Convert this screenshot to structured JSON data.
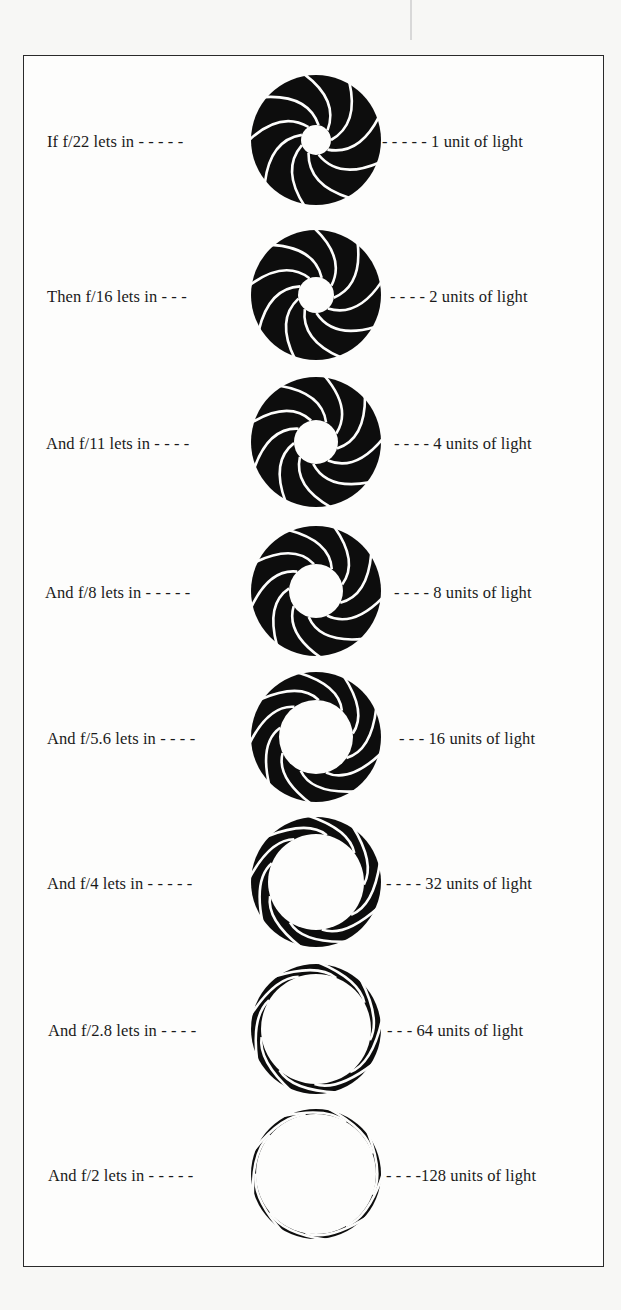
{
  "figure": {
    "title": "",
    "ink_color": "#0d0d0d",
    "paper_color": "#fdfdfc",
    "rows": [
      {
        "left": "If f/22 lets in - - - - -",
        "right": "- - - - - 1 unit of light",
        "f_stop": "f/22",
        "units": 1,
        "inner_radius": 15
      },
      {
        "left": "Then f/16 lets in - - -",
        "right": "- - - - 2 units of light",
        "f_stop": "f/16",
        "units": 2,
        "inner_radius": 18
      },
      {
        "left": "And f/11 lets in - - - -",
        "right": "- - - - 4 units of light",
        "f_stop": "f/11",
        "units": 4,
        "inner_radius": 22
      },
      {
        "left": "And f/8 lets in - - - - -",
        "right": "- - - - 8 units of light",
        "f_stop": "f/8",
        "units": 8,
        "inner_radius": 27
      },
      {
        "left": "And f/5.6 lets in - - - -",
        "right": "- - - 16 units of light",
        "f_stop": "f/5.6",
        "units": 16,
        "inner_radius": 37
      },
      {
        "left": "And f/4 lets in - - - - -",
        "right": "- - - - 32 units of light",
        "f_stop": "f/4",
        "units": 32,
        "inner_radius": 48
      },
      {
        "left": "And f/2.8 lets in - - - -",
        "right": "- - -  64 units of light",
        "f_stop": "f/2.8",
        "units": 64,
        "inner_radius": 55
      },
      {
        "left": "And f/2 lets in - - - - -",
        "right": "- - - -128 units of light",
        "f_stop": "f/2",
        "units": 128,
        "inner_radius": 60
      }
    ]
  }
}
